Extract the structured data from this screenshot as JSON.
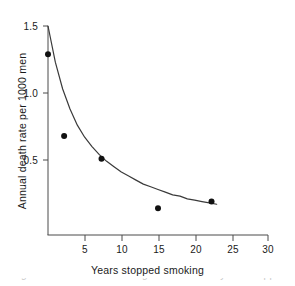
{
  "chart_data": {
    "type": "scatter",
    "title": "",
    "xlabel": "Years stopped smoking",
    "ylabel": "Annual death rate per 1000 men",
    "xlim": [
      0,
      30
    ],
    "ylim": [
      0,
      1.5
    ],
    "grid": false,
    "legend": null,
    "xticks": [
      5,
      10,
      15,
      20,
      25,
      30
    ],
    "xtick_labels": [
      "5",
      "10",
      "15",
      "20",
      "25",
      "30"
    ],
    "yticks": [
      0.5,
      1.0,
      1.5
    ],
    "ytick_labels": [
      "0.5",
      "1.0",
      "1.5"
    ],
    "points": [
      {
        "x": 0.0,
        "y": 1.29
      },
      {
        "x": 2.2,
        "y": 0.68
      },
      {
        "x": 7.3,
        "y": 0.51
      },
      {
        "x": 15.0,
        "y": 0.14
      },
      {
        "x": 22.3,
        "y": 0.19
      }
    ],
    "series": [
      {
        "name": "observed death rate",
        "type": "scatter",
        "x": [
          0.0,
          2.2,
          7.3,
          15.0,
          22.3
        ],
        "values": [
          1.29,
          0.68,
          0.51,
          0.14,
          0.19
        ]
      },
      {
        "name": "fitted curve",
        "type": "line",
        "x": [
          0.0,
          1.0,
          2.0,
          3.0,
          4.0,
          5.0,
          6.0,
          7.0,
          8.0,
          9.0,
          10.0,
          11.0,
          12.0,
          13.0,
          14.0,
          15.0,
          16.0,
          17.0,
          18.0,
          19.0,
          20.0,
          21.0,
          22.0,
          23.0
        ],
        "values": [
          1.5,
          1.23,
          1.03,
          0.88,
          0.76,
          0.67,
          0.6,
          0.54,
          0.49,
          0.45,
          0.41,
          0.38,
          0.35,
          0.32,
          0.3,
          0.28,
          0.26,
          0.24,
          0.23,
          0.21,
          0.2,
          0.19,
          0.18,
          0.17
        ]
      }
    ],
    "annotations": []
  },
  "caption": {
    "clipped_text": "Fig. 5.2 Death rate from lung cancer versus years stopped smoking"
  },
  "colors": {
    "axis": "#4a4a4a",
    "curve": "#3a3a3a",
    "marker": "#111111",
    "background": "#ffffff",
    "text": "#1a1a1a"
  }
}
